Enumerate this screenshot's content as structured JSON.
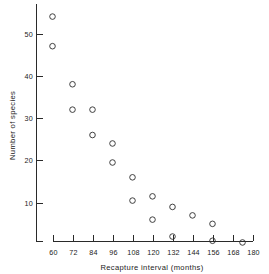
{
  "chart_data": {
    "type": "scatter",
    "title": "",
    "xlabel": "Recapture interval (months)",
    "ylabel": "Number of species",
    "xlim": [
      60,
      180
    ],
    "ylim": [
      0,
      56
    ],
    "grid": false,
    "legend": null,
    "xticks": [
      60,
      72,
      84,
      96,
      108,
      120,
      132,
      144,
      156,
      168,
      180
    ],
    "xtick_labels": [
      "60",
      "72",
      "84",
      "96",
      "108",
      "120",
      "132",
      "144",
      "156",
      "168",
      "180"
    ],
    "yticks": [
      10,
      20,
      30,
      40,
      50
    ],
    "ytick_labels": [
      "10",
      "20",
      "30",
      "40",
      "50"
    ],
    "marker": "open-circle",
    "points": [
      {
        "x": 60,
        "y": 54
      },
      {
        "x": 60,
        "y": 47
      },
      {
        "x": 72,
        "y": 38
      },
      {
        "x": 72,
        "y": 32
      },
      {
        "x": 84,
        "y": 32
      },
      {
        "x": 84,
        "y": 26
      },
      {
        "x": 96,
        "y": 24
      },
      {
        "x": 96,
        "y": 19.5
      },
      {
        "x": 108,
        "y": 16
      },
      {
        "x": 108,
        "y": 10.5
      },
      {
        "x": 120,
        "y": 11.5
      },
      {
        "x": 120,
        "y": 6
      },
      {
        "x": 132,
        "y": 9
      },
      {
        "x": 132,
        "y": 2
      },
      {
        "x": 144,
        "y": 7
      },
      {
        "x": 156,
        "y": 5
      },
      {
        "x": 156,
        "y": 1
      },
      {
        "x": 174,
        "y": 0.6
      }
    ]
  },
  "axes": {
    "x_axis_label": "Recapture interval (months)",
    "y_axis_label": "Number of species"
  }
}
